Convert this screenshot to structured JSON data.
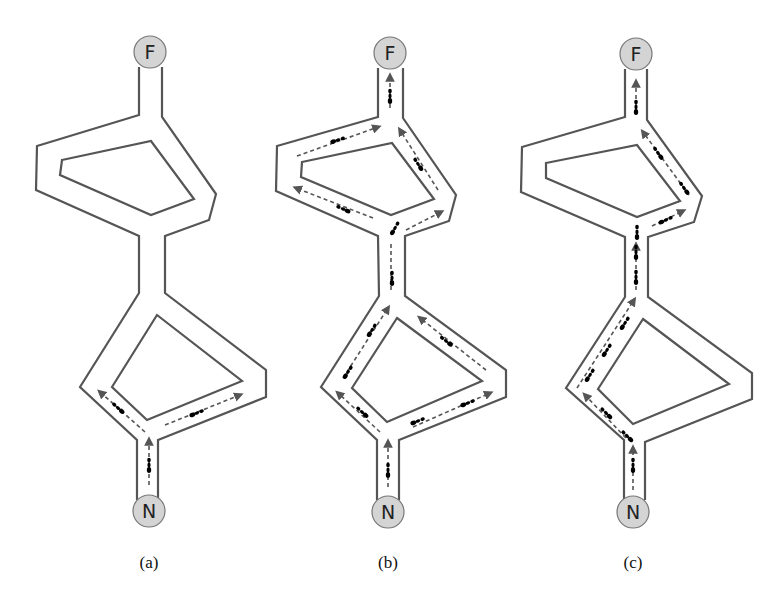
{
  "figure": {
    "panels": [
      {
        "id": "a",
        "caption": "(a)",
        "food_label": "F",
        "nest_label": "N",
        "description": "Ants leave nest N and split equally between the left and right branches of the lower loop"
      },
      {
        "id": "b",
        "caption": "(b)",
        "food_label": "F",
        "nest_label": "N",
        "description": "Ants distributed over all branches of both loops, travelling toward food F"
      },
      {
        "id": "c",
        "caption": "(c)",
        "food_label": "F",
        "nest_label": "N",
        "description": "Ants converge on the shortest path: left branch of the lower loop and right branch of the upper loop"
      }
    ]
  },
  "colors": {
    "wall": "#555555",
    "node_fill": "#d4d4d4",
    "ant": "#4a4a4a"
  }
}
